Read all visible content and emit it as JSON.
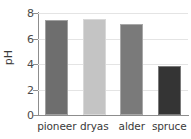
{
  "chart_data": {
    "type": "bar",
    "title": "",
    "xlabel": "",
    "ylabel": "pH",
    "categories": [
      "pioneer",
      "dryas",
      "alder",
      "spruce"
    ],
    "values": [
      7.45,
      7.5,
      7.1,
      3.85
    ],
    "ylim": [
      0,
      8
    ],
    "yticks": [
      0,
      2,
      4,
      6,
      8
    ],
    "ytick_labels": [
      "0",
      "2",
      "4",
      "6",
      "8"
    ],
    "grid": true,
    "legend": false,
    "bar_colors": [
      "#6e6e6e",
      "#c4c4c4",
      "#7a7a7a",
      "#343434"
    ],
    "grid_color": "#e4e4e4",
    "axis_color": "#8d8d8d",
    "background": "#ffffff"
  }
}
